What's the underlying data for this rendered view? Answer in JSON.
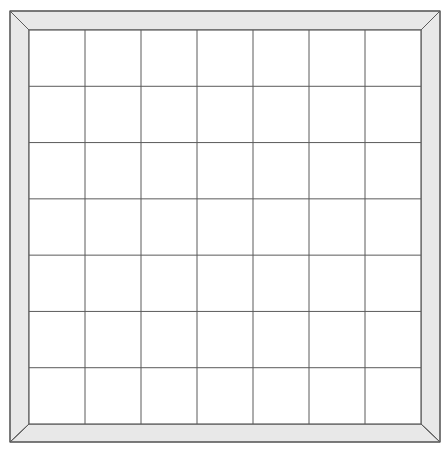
{
  "board": {
    "rows": 7,
    "cols": 7,
    "frame_outer": {
      "x1": 10,
      "y1": 11,
      "x2": 440,
      "y2": 442
    },
    "grid_inner": {
      "x1": 29,
      "y1": 30,
      "x2": 421,
      "y2": 424
    },
    "colors": {
      "background": "#ffffff",
      "frame_fill": "#e8e8e8",
      "line": "#5a5a5a",
      "cell_fill": "#ffffff"
    }
  }
}
